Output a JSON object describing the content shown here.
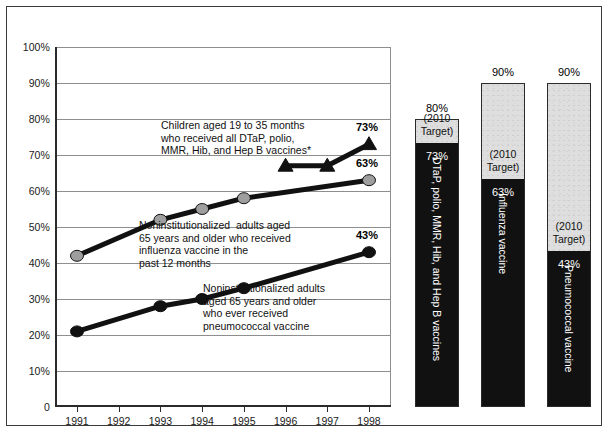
{
  "chart_data": {
    "type": "line",
    "title": "",
    "xlabel": "",
    "ylabel": "",
    "x": [
      "1991",
      "1992",
      "1993",
      "1994",
      "1995",
      "1996",
      "1997",
      "1998"
    ],
    "xlim": [
      1990.5,
      1998.5
    ],
    "ylim": [
      0,
      100
    ],
    "grid": true,
    "legend_position": "inline-annotations",
    "ytick_labels": [
      "0",
      "10%",
      "20%",
      "30%",
      "40%",
      "50%",
      "60%",
      "70%",
      "80%",
      "90%",
      "100%"
    ],
    "ytick_values": [
      0,
      10,
      20,
      30,
      40,
      50,
      60,
      70,
      80,
      90,
      100
    ],
    "series": [
      {
        "name": "Children aged 19 to 35 months who received all DTaP, polio, MMR, Hib, and Hep B vaccines*",
        "marker": "triangle",
        "color": "#111111",
        "points": [
          {
            "x": "1996",
            "y": 67
          },
          {
            "x": "1997",
            "y": 67
          },
          {
            "x": "1998",
            "y": 73
          }
        ],
        "end_label": "73%"
      },
      {
        "name": "Noninstitutionalized adults aged 65 years and older who received influenza vaccine in the past 12 months",
        "marker": "circle",
        "color": "#9e9e9e",
        "points": [
          {
            "x": "1991",
            "y": 42
          },
          {
            "x": "1993",
            "y": 52
          },
          {
            "x": "1994",
            "y": 55
          },
          {
            "x": "1995",
            "y": 58
          },
          {
            "x": "1998",
            "y": 63
          }
        ],
        "end_label": "63%"
      },
      {
        "name": "Noninstitutionalized adults aged 65 years and older who ever received pneumococcal vaccine",
        "marker": "circle",
        "color": "#111111",
        "points": [
          {
            "x": "1991",
            "y": 21
          },
          {
            "x": "1993",
            "y": 28
          },
          {
            "x": "1994",
            "y": 30
          },
          {
            "x": "1995",
            "y": 33
          },
          {
            "x": "1998",
            "y": 43
          }
        ],
        "end_label": "43%"
      }
    ],
    "annotations": [
      {
        "id": "children-annotation",
        "text": "Children aged 19 to 35 months\nwho received all DTaP, polio,\nMMR, Hib, and Hep B vaccines*"
      },
      {
        "id": "influenza-annotation",
        "text": "Noninstitutionalized  adults aged\n65 years and older who received\ninfluenza vaccine in the\npast 12 months"
      },
      {
        "id": "pneumococcal-annotation",
        "text": "Noninstitutionalized adults\naged 65 years and older\nwho ever received\npneumococcal vaccine"
      }
    ],
    "target_bars": {
      "type": "bar",
      "target_caption": "(2010\nTarget)",
      "bars": [
        {
          "id": "dtap-bar",
          "label": "DTaP, polio, MMR, Hib, and Hep B vaccines",
          "target": 80,
          "target_label": "80%",
          "value": 73,
          "value_label": "73%"
        },
        {
          "id": "influenza-bar",
          "label": "Influenza vaccine",
          "target": 90,
          "target_label": "90%",
          "value": 63,
          "value_label": "63%"
        },
        {
          "id": "pneumococcal-bar",
          "label": "Pneumococcal vaccine",
          "target": 90,
          "target_label": "90%",
          "value": 43,
          "value_label": "43%"
        }
      ]
    }
  }
}
